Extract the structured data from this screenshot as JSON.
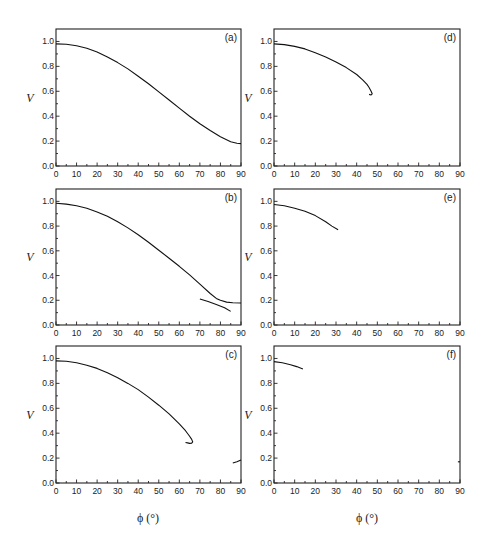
{
  "figure": {
    "xlabel_text": "ϕ (°)",
    "ylabel_text": "V"
  },
  "chart_data": [
    {
      "type": "line",
      "panel": "(a)",
      "xlabel": "",
      "ylabel": "V",
      "xlim": [
        0,
        90
      ],
      "ylim": [
        0,
        1.1
      ],
      "xticks": [
        0,
        10,
        20,
        30,
        40,
        50,
        60,
        70,
        80,
        90
      ],
      "yticks": [
        0.0,
        0.2,
        0.4,
        0.6,
        0.8,
        1.0
      ],
      "series": [
        {
          "name": "branch1",
          "x": [
            0,
            5,
            10,
            15,
            20,
            25,
            30,
            35,
            40,
            45,
            50,
            55,
            60,
            65,
            70,
            75,
            80,
            85,
            88,
            90
          ],
          "y": [
            0.98,
            0.977,
            0.965,
            0.945,
            0.915,
            0.875,
            0.83,
            0.78,
            0.72,
            0.66,
            0.595,
            0.53,
            0.465,
            0.4,
            0.34,
            0.285,
            0.235,
            0.195,
            0.183,
            0.18
          ]
        }
      ]
    },
    {
      "type": "line",
      "panel": "(b)",
      "xlabel": "",
      "ylabel": "V",
      "xlim": [
        0,
        90
      ],
      "ylim": [
        0,
        1.1
      ],
      "xticks": [
        0,
        10,
        20,
        30,
        40,
        50,
        60,
        70,
        80,
        90
      ],
      "yticks": [
        0.0,
        0.2,
        0.4,
        0.6,
        0.8,
        1.0
      ],
      "series": [
        {
          "name": "branch1",
          "x": [
            0,
            5,
            10,
            15,
            20,
            25,
            30,
            35,
            40,
            45,
            50,
            55,
            60,
            65,
            70,
            75,
            78,
            80,
            83,
            86,
            90
          ],
          "y": [
            0.985,
            0.978,
            0.965,
            0.945,
            0.915,
            0.88,
            0.835,
            0.785,
            0.73,
            0.67,
            0.605,
            0.54,
            0.475,
            0.405,
            0.33,
            0.255,
            0.215,
            0.2,
            0.185,
            0.18,
            0.178
          ]
        },
        {
          "name": "branch2",
          "x": [
            70,
            74,
            78,
            82,
            85
          ],
          "y": [
            0.21,
            0.19,
            0.165,
            0.14,
            0.11
          ]
        }
      ]
    },
    {
      "type": "line",
      "panel": "(c)",
      "xlabel": "ϕ (°)",
      "ylabel": "V",
      "xlim": [
        0,
        90
      ],
      "ylim": [
        0,
        1.1
      ],
      "xticks": [
        0,
        10,
        20,
        30,
        40,
        50,
        60,
        70,
        80,
        90
      ],
      "yticks": [
        0.0,
        0.2,
        0.4,
        0.6,
        0.8,
        1.0
      ],
      "series": [
        {
          "name": "branch1",
          "x": [
            0,
            5,
            10,
            15,
            20,
            25,
            30,
            35,
            40,
            45,
            50,
            55,
            60,
            63,
            65,
            66,
            66.5,
            66,
            65,
            64,
            63
          ],
          "y": [
            0.98,
            0.977,
            0.965,
            0.945,
            0.92,
            0.885,
            0.845,
            0.8,
            0.75,
            0.69,
            0.625,
            0.555,
            0.475,
            0.42,
            0.375,
            0.35,
            0.33,
            0.32,
            0.318,
            0.322,
            0.325
          ]
        },
        {
          "name": "branch2",
          "x": [
            86,
            88,
            90
          ],
          "y": [
            0.16,
            0.17,
            0.185
          ]
        }
      ]
    },
    {
      "type": "line",
      "panel": "(d)",
      "xlabel": "",
      "ylabel": "V",
      "xlim": [
        0,
        90
      ],
      "ylim": [
        0,
        1.1
      ],
      "xticks": [
        0,
        10,
        20,
        30,
        40,
        50,
        60,
        70,
        80,
        90
      ],
      "yticks": [
        0.0,
        0.2,
        0.4,
        0.6,
        0.8,
        1.0
      ],
      "series": [
        {
          "name": "branch1",
          "x": [
            0,
            5,
            10,
            15,
            20,
            25,
            30,
            35,
            40,
            43,
            45,
            46,
            47,
            47.5,
            47,
            46
          ],
          "y": [
            0.98,
            0.975,
            0.96,
            0.94,
            0.91,
            0.875,
            0.835,
            0.79,
            0.735,
            0.69,
            0.655,
            0.63,
            0.6,
            0.58,
            0.57,
            0.575
          ]
        }
      ]
    },
    {
      "type": "line",
      "panel": "(e)",
      "xlabel": "",
      "ylabel": "V",
      "xlim": [
        0,
        90
      ],
      "ylim": [
        0,
        1.1
      ],
      "xticks": [
        0,
        10,
        20,
        30,
        40,
        50,
        60,
        70,
        80,
        90
      ],
      "yticks": [
        0.0,
        0.2,
        0.4,
        0.6,
        0.8,
        1.0
      ],
      "series": [
        {
          "name": "branch1",
          "x": [
            0,
            5,
            10,
            15,
            20,
            25,
            28,
            31
          ],
          "y": [
            0.975,
            0.965,
            0.945,
            0.92,
            0.885,
            0.835,
            0.8,
            0.77
          ]
        }
      ]
    },
    {
      "type": "line",
      "panel": "(f)",
      "xlabel": "ϕ (°)",
      "ylabel": "V",
      "xlim": [
        0,
        90
      ],
      "ylim": [
        0,
        1.1
      ],
      "xticks": [
        0,
        10,
        20,
        30,
        40,
        50,
        60,
        70,
        80,
        90
      ],
      "yticks": [
        0.0,
        0.2,
        0.4,
        0.6,
        0.8,
        1.0
      ],
      "series": [
        {
          "name": "branch1",
          "x": [
            0,
            4,
            8,
            11,
            14
          ],
          "y": [
            0.975,
            0.965,
            0.95,
            0.935,
            0.915
          ]
        },
        {
          "name": "branch2",
          "x": [
            89,
            90
          ],
          "y": [
            0.17,
            0.17
          ]
        }
      ]
    }
  ],
  "layout": {
    "panels": [
      {
        "id": "a",
        "x0": 56,
        "x1": 241,
        "y0": 166,
        "ytop": 29
      },
      {
        "id": "b",
        "x0": 56,
        "x1": 241,
        "y0": 325,
        "ytop": 189
      },
      {
        "id": "c",
        "x0": 56,
        "x1": 241,
        "y0": 483,
        "ytop": 346
      },
      {
        "id": "d",
        "x0": 274,
        "x1": 460,
        "y0": 166,
        "ytop": 29
      },
      {
        "id": "e",
        "x0": 274,
        "x1": 460,
        "y0": 325,
        "ytop": 189
      },
      {
        "id": "f",
        "x0": 274,
        "x1": 460,
        "y0": 483,
        "ytop": 346
      }
    ]
  }
}
